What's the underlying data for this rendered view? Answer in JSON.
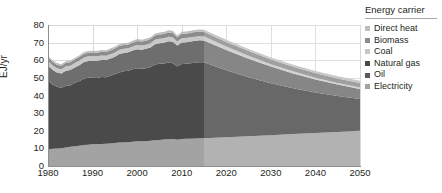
{
  "chart_data": {
    "type": "area",
    "title": "",
    "xlabel": "",
    "ylabel": "EJ/yr",
    "xlim": [
      1980,
      2050
    ],
    "ylim": [
      0,
      80
    ],
    "grid": true,
    "stacked": true,
    "legend_position": "right",
    "legend_title": "Energy carrier",
    "y_ticks": [
      0,
      10,
      20,
      30,
      40,
      50,
      60,
      70,
      80
    ],
    "x_ticks": [
      1980,
      1990,
      2000,
      2010,
      2020,
      2030,
      2040,
      2050
    ],
    "projection_start": 2015,
    "annotations": {
      "projection_note": "Shaded region from 2015 onward indicates projection"
    },
    "x": [
      1980,
      1981,
      1982,
      1983,
      1984,
      1985,
      1986,
      1987,
      1988,
      1989,
      1990,
      1991,
      1992,
      1993,
      1994,
      1995,
      1996,
      1997,
      1998,
      1999,
      2000,
      2001,
      2002,
      2003,
      2004,
      2005,
      2006,
      2007,
      2008,
      2009,
      2010,
      2011,
      2012,
      2013,
      2014,
      2015,
      2020,
      2025,
      2030,
      2035,
      2040,
      2045,
      2050
    ],
    "series": [
      {
        "name": "Electricity",
        "color": "#a3a3a3",
        "values": [
          9.5,
          9.8,
          9.9,
          10.1,
          10.5,
          10.9,
          11.2,
          11.5,
          11.9,
          12.1,
          12.3,
          12.4,
          12.5,
          12.6,
          12.8,
          13.0,
          13.3,
          13.4,
          13.5,
          13.7,
          14.0,
          14.0,
          14.1,
          14.3,
          14.6,
          14.8,
          15.0,
          15.2,
          15.3,
          14.9,
          15.3,
          15.4,
          15.5,
          15.6,
          15.7,
          15.8,
          16.3,
          16.9,
          17.5,
          18.1,
          18.7,
          19.3,
          20.0
        ]
      },
      {
        "name": "Oil",
        "color": "#4a4a4a",
        "values": [
          39.0,
          36.5,
          35.0,
          34.2,
          35.0,
          34.8,
          36.0,
          36.6,
          37.6,
          38.0,
          37.8,
          37.6,
          38.0,
          37.8,
          38.4,
          39.0,
          39.8,
          40.4,
          40.6,
          41.2,
          41.4,
          41.2,
          41.4,
          41.8,
          43.0,
          43.2,
          43.2,
          43.5,
          43.0,
          41.6,
          42.6,
          42.6,
          42.8,
          43.0,
          43.2,
          43.0,
          38.0,
          33.5,
          29.5,
          26.0,
          23.0,
          20.4,
          18.0
        ]
      },
      {
        "name": "Natural gas",
        "color": "#6e6e6e",
        "values": [
          8.5,
          8.3,
          8.2,
          8.2,
          8.6,
          8.7,
          8.7,
          9.0,
          9.3,
          9.5,
          9.6,
          9.7,
          9.7,
          9.8,
          9.8,
          10.0,
          10.4,
          10.3,
          10.4,
          10.6,
          10.9,
          10.8,
          11.0,
          11.2,
          11.5,
          11.7,
          11.8,
          12.1,
          12.2,
          11.8,
          12.2,
          12.2,
          12.3,
          12.4,
          12.4,
          12.4,
          11.5,
          10.5,
          9.4,
          8.4,
          7.4,
          6.5,
          5.7
        ]
      },
      {
        "name": "Coal",
        "color": "#c8c8c8",
        "values": [
          2.6,
          2.5,
          2.4,
          2.4,
          2.5,
          2.5,
          2.5,
          2.6,
          2.6,
          2.6,
          2.6,
          2.5,
          2.5,
          2.4,
          2.4,
          2.4,
          2.4,
          2.4,
          2.3,
          2.3,
          2.3,
          2.3,
          2.3,
          2.4,
          2.5,
          2.5,
          2.5,
          2.5,
          2.5,
          2.3,
          2.4,
          2.4,
          2.4,
          2.4,
          2.4,
          2.3,
          2.0,
          1.7,
          1.4,
          1.2,
          1.0,
          0.9,
          0.8
        ]
      },
      {
        "name": "Biomass",
        "color": "#8c8c8c",
        "values": [
          2.0,
          2.0,
          2.0,
          2.0,
          2.0,
          2.0,
          2.0,
          2.1,
          2.1,
          2.1,
          2.1,
          2.1,
          2.1,
          2.1,
          2.2,
          2.2,
          2.2,
          2.2,
          2.2,
          2.2,
          2.3,
          2.3,
          2.3,
          2.3,
          2.4,
          2.4,
          2.4,
          2.5,
          2.5,
          2.4,
          2.5,
          2.5,
          2.6,
          2.6,
          2.6,
          2.6,
          2.6,
          2.6,
          2.6,
          2.6,
          2.6,
          2.6,
          2.6
        ]
      },
      {
        "name": "Direct heat",
        "color": "#bdbdbd",
        "values": [
          0.9,
          0.9,
          0.9,
          0.9,
          0.9,
          0.9,
          0.9,
          0.9,
          1.0,
          1.0,
          1.0,
          1.0,
          1.0,
          1.0,
          1.0,
          1.0,
          1.0,
          1.0,
          1.0,
          1.0,
          1.1,
          1.1,
          1.1,
          1.1,
          1.1,
          1.1,
          1.1,
          1.2,
          1.2,
          1.1,
          1.2,
          1.2,
          1.2,
          1.2,
          1.2,
          1.2,
          1.2,
          1.2,
          1.2,
          1.2,
          1.2,
          1.2,
          1.2
        ]
      }
    ]
  },
  "legend": {
    "title": "Energy carrier",
    "items": [
      {
        "label": "Direct heat",
        "color": "#bdbdbd"
      },
      {
        "label": "Biomass",
        "color": "#8c8c8c"
      },
      {
        "label": "Coal",
        "color": "#c8c8c8"
      },
      {
        "label": "Natural gas",
        "color": "#4a4a4a"
      },
      {
        "label": "Oil",
        "color": "#5a5a5a"
      },
      {
        "label": "Electricity",
        "color": "#a3a3a3"
      }
    ]
  },
  "axes": {
    "y_label": "EJ/yr",
    "y_ticks": [
      "0",
      "10",
      "20",
      "30",
      "40",
      "50",
      "60",
      "70",
      "80"
    ],
    "x_ticks": [
      "1980",
      "1990",
      "2000",
      "2010",
      "2020",
      "2030",
      "2040",
      "2050"
    ]
  }
}
